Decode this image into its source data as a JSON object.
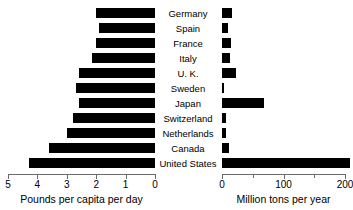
{
  "chart_data": {
    "type": "bar",
    "title": "",
    "subtitle": "",
    "orientation": "horizontal",
    "layout": "bidirectional-butterfly",
    "grid": false,
    "legend": null,
    "categories": [
      "Germany",
      "Spain",
      "France",
      "Italy",
      "U. K.",
      "Sweden",
      "Japan",
      "Switzerland",
      "Netherlands",
      "Canada",
      "United States"
    ],
    "series": [
      {
        "name": "Pounds per capita per day",
        "axis": "left",
        "direction": "right-to-left",
        "xlabel": "Pounds per capita per day",
        "ylabel": "",
        "xlim": [
          5,
          0
        ],
        "ticks": [
          5,
          4,
          3,
          2,
          1,
          0
        ],
        "tick_labels": [
          "5",
          "4",
          "3",
          "2",
          "1",
          "0"
        ],
        "values": [
          2.0,
          1.9,
          2.0,
          2.15,
          2.6,
          2.7,
          2.6,
          2.8,
          3.0,
          3.6,
          4.3
        ]
      },
      {
        "name": "Million tons per year",
        "axis": "right",
        "direction": "left-to-right",
        "xlabel": "Million tons per year",
        "ylabel": "",
        "xlim": [
          0,
          200
        ],
        "ticks": [
          0,
          50,
          100,
          150,
          200
        ],
        "tick_labels": [
          "0",
          "",
          "100",
          "",
          "200"
        ],
        "values": [
          17,
          10,
          15,
          13,
          22,
          4,
          68,
          6,
          7,
          12,
          208
        ]
      }
    ]
  },
  "axes": {
    "left": {
      "title": "Pounds per capita per day",
      "tick_labels": [
        "5",
        "4",
        "3",
        "2",
        "1",
        "0"
      ]
    },
    "right": {
      "title": "Million tons per year",
      "tick_labels": [
        "0",
        "",
        "100",
        "",
        "200"
      ]
    }
  },
  "colors": {
    "bar": "#000000",
    "axis": "#6b6b6b",
    "text": "#000000",
    "background": "#ffffff"
  }
}
